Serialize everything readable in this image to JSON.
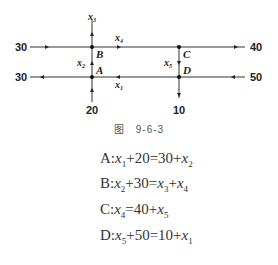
{
  "figure": {
    "caption": "图　9-6-3",
    "nodes": {
      "A": "A",
      "B": "B",
      "C": "C",
      "D": "D"
    },
    "flows": {
      "left_top": "30",
      "left_bottom": "30",
      "right_top": "40",
      "right_bottom": "50",
      "bottom_left": "20",
      "bottom_right": "10"
    },
    "variables": {
      "x1": {
        "base": "x",
        "sub": "1"
      },
      "x2": {
        "base": "x",
        "sub": "2"
      },
      "x3": {
        "base": "x",
        "sub": "3"
      },
      "x4": {
        "base": "x",
        "sub": "4"
      },
      "x5": {
        "base": "x",
        "sub": "5"
      }
    }
  },
  "equations": [
    {
      "node": "A",
      "text": "A：x₁+20=30+x₂"
    },
    {
      "node": "B",
      "text": "B：x₂+30=x₃+x₄"
    },
    {
      "node": "C",
      "text": "C：x₄=40+x₅"
    },
    {
      "node": "D",
      "text": "D：x₅+50=10+x₁"
    }
  ],
  "equation_parts": {
    "A": [
      "A",
      "x",
      "1",
      "+20=30+",
      "x",
      "2",
      ""
    ],
    "B": [
      "B",
      "x",
      "2",
      "+30=",
      "x",
      "3",
      "+",
      "x",
      "4"
    ],
    "C": [
      "C",
      "x",
      "4",
      "=40+",
      "x",
      "5"
    ],
    "D": [
      "D",
      "x",
      "5",
      "+50=10+",
      "x",
      "1"
    ]
  }
}
